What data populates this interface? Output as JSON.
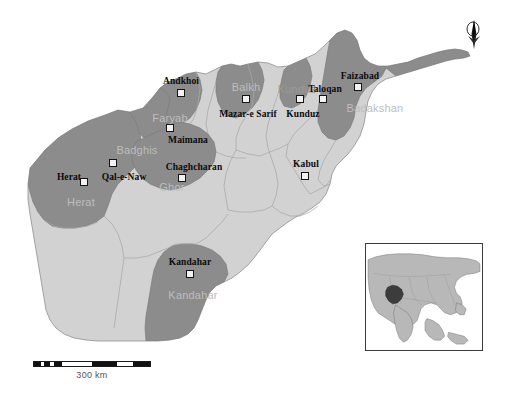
{
  "map": {
    "title": "Afghanistan provinces reference map",
    "country": "Afghanistan",
    "scale_bar": {
      "caption": "300 km",
      "units": "km",
      "total_length_km": 300
    },
    "north_arrow": {
      "icon": "north-arrow-icon",
      "label": "N"
    },
    "inset": {
      "name": "asia-locator-inset",
      "highlight_country": "Afghanistan"
    },
    "colors": {
      "highlight_province_fill": "#8c8c8c",
      "base_province_fill": "#d2d2d2",
      "province_border": "#9a9a9a",
      "country_border": "#7a7a7a",
      "city_marker_fill": "#f2f2f2",
      "city_marker_border": "#141414",
      "city_label": "#0b0b0b",
      "province_label": "#9a9a9a",
      "province_label_on_dark": "#bdbdbd",
      "background": "#ffffff"
    },
    "cities": [
      {
        "name": "Andkhoi",
        "x": 181,
        "y": 93,
        "label_x": 181,
        "label_y": 77
      },
      {
        "name": "Mazar-e Sarif",
        "x": 246,
        "y": 99,
        "label_x": 248,
        "label_y": 110
      },
      {
        "name": "Kunduz",
        "x": 300,
        "y": 99,
        "label_x": 303,
        "label_y": 110
      },
      {
        "name": "Taloqan",
        "x": 323,
        "y": 99,
        "label_x": 325,
        "label_y": 85
      },
      {
        "name": "Faizabad",
        "x": 358,
        "y": 87,
        "label_x": 360,
        "label_y": 72
      },
      {
        "name": "Maimana",
        "x": 170,
        "y": 128,
        "label_x": 188,
        "label_y": 136
      },
      {
        "name": "Qal-e-Naw",
        "x": 113,
        "y": 163,
        "label_x": 124,
        "label_y": 173
      },
      {
        "name": "Herat",
        "x": 84,
        "y": 182,
        "label_x": 69,
        "label_y": 173
      },
      {
        "name": "Chaghcharan",
        "x": 182,
        "y": 178,
        "label_x": 194,
        "label_y": 163
      },
      {
        "name": "Kabul",
        "x": 305,
        "y": 176,
        "label_x": 306,
        "label_y": 160
      },
      {
        "name": "Kandahar",
        "x": 190,
        "y": 274,
        "label_x": 190,
        "label_y": 258
      }
    ],
    "provinces": [
      {
        "name": "Faryab",
        "label_x": 170,
        "label_y": 113,
        "on_dark": false
      },
      {
        "name": "Balkh",
        "label_x": 246,
        "label_y": 82,
        "on_dark": true
      },
      {
        "name": "Kunduz",
        "label_x": 297,
        "label_y": 84,
        "on_dark": false
      },
      {
        "name": "Badakshan",
        "label_x": 375,
        "label_y": 103,
        "on_dark": true
      },
      {
        "name": "Badghis",
        "label_x": 137,
        "label_y": 145,
        "on_dark": true
      },
      {
        "name": "Ghor",
        "label_x": 172,
        "label_y": 182,
        "on_dark": true
      },
      {
        "name": "Herat",
        "label_x": 81,
        "label_y": 197,
        "on_dark": true
      },
      {
        "name": "Kandahar",
        "label_x": 193,
        "label_y": 290,
        "on_dark": true
      }
    ]
  }
}
